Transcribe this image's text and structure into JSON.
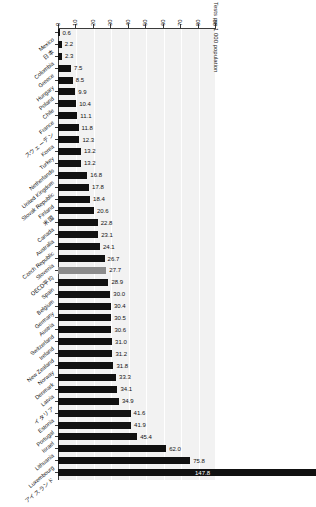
{
  "chart_data": {
    "type": "bar",
    "orientation": "horizontal",
    "title": "",
    "xlabel": "Tests per 1 000 population",
    "ylabel": "",
    "xlim": [
      0,
      90
    ],
    "xticks": [
      0,
      10,
      20,
      30,
      40,
      50,
      60,
      70,
      80,
      90
    ],
    "grid": true,
    "legend": null,
    "highlight_category": "OECD平均",
    "highlight_color": "#8c8c8c",
    "bar_color": "#111111",
    "plot_background": "#f2f2f2",
    "categories": [
      "Mexico",
      "日本",
      "Colombia",
      "Greece",
      "Hungary",
      "Poland",
      "Chile",
      "France",
      "スウェーデン",
      "Korea",
      "Turkey",
      "Netherlands",
      "United Kingdom",
      "Slovak Republic",
      "Finland",
      "米国",
      "Canada",
      "Australia",
      "Czech Republic",
      "Slovenia",
      "OECD平均",
      "Spain",
      "Belgium",
      "Germany",
      "Austria",
      "Switzerland",
      "Ireland",
      "New Zealand",
      "Norway",
      "Denmark",
      "Latvia",
      "イタリア",
      "Estonia",
      "Portugal",
      "Israel",
      "Lithuania",
      "Luxembourg",
      "アイスランド"
    ],
    "values": [
      0.6,
      2.2,
      2.3,
      7.5,
      8.5,
      9.9,
      10.4,
      11.1,
      11.8,
      12.3,
      13.2,
      13.2,
      16.8,
      17.8,
      18.4,
      20.6,
      22.8,
      23.1,
      24.1,
      26.7,
      27.7,
      28.9,
      30.0,
      30.4,
      30.5,
      30.6,
      31.0,
      31.2,
      31.8,
      33.3,
      34.1,
      34.9,
      41.6,
      41.9,
      45.4,
      62.0,
      75.8,
      147.8
    ],
    "value_labels": [
      "0.6",
      "2.2",
      "2.3",
      "7.5",
      "8.5",
      "9.9",
      "10.4",
      "11.1",
      "11.8",
      "12.3",
      "13.2",
      "13.2",
      "16.8",
      "17.8",
      "18.4",
      "20.6",
      "22.8",
      "23.1",
      "24.1",
      "26.7",
      "27.7",
      "28.9",
      "30.0",
      "30.4",
      "30.5",
      "30.6",
      "31.0",
      "31.2",
      "31.8",
      "33.3",
      "34.1",
      "34.9",
      "41.6",
      "41.9",
      "45.4",
      "62.0",
      "75.8",
      "147.8"
    ]
  }
}
